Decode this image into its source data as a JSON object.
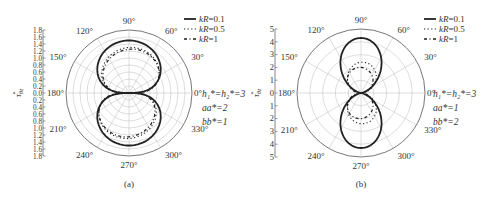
{
  "chart_data": [
    {
      "type": "polar-line",
      "panel_label": "(a)",
      "ylabel": "τ*_θz",
      "radial_range": [
        0,
        1.8
      ],
      "radial_ticks": [
        0.2,
        0.4,
        0.6,
        0.8,
        1.0,
        1.2,
        1.4,
        1.6,
        1.8
      ],
      "axis_tick_labels": [
        "1.8",
        "1.6",
        "1.4",
        "1.2",
        "1.0",
        "0.8",
        "0.6",
        "0.4",
        "0.2",
        "0.0",
        "0.2",
        "0.4",
        "0.6",
        "0.8",
        "1.0",
        "1.2",
        "1.4",
        "1.6",
        "1.8"
      ],
      "angle_labels": [
        "0°",
        "30°",
        "60°",
        "90°",
        "120°",
        "150°",
        "180°",
        "210°",
        "240°",
        "270°",
        "300°",
        "330°"
      ],
      "parameters": [
        "h₁*=h₂*=3",
        "aa*=2",
        "bb*=1"
      ],
      "legend": [
        {
          "name": "kR=0.1",
          "style": "solid"
        },
        {
          "name": "kR=0.5",
          "style": "dotted"
        },
        {
          "name": "kR=1",
          "style": "dashdot"
        }
      ],
      "series": [
        {
          "name": "kR=0.1",
          "peak": 1.5,
          "shape": "lobe",
          "width": 1.0,
          "style": "solid"
        },
        {
          "name": "kR=0.5",
          "peak": 1.3,
          "shape": "lobe",
          "width": 0.85,
          "skew": 0.25,
          "style": "dotted"
        },
        {
          "name": "kR=1",
          "peak": 1.25,
          "shape": "lobe",
          "width": 0.8,
          "skew": 0.35,
          "style": "dashdot"
        }
      ]
    },
    {
      "type": "polar-line",
      "panel_label": "(b)",
      "ylabel": "τ*_θz",
      "radial_range": [
        0,
        5
      ],
      "radial_ticks": [
        1,
        2,
        3,
        4,
        5
      ],
      "axis_tick_labels": [
        "5",
        "4",
        "3",
        "2",
        "1",
        "0",
        "1",
        "2",
        "3",
        "4",
        "5"
      ],
      "angle_labels": [
        "0°",
        "30°",
        "60°",
        "90°",
        "120°",
        "150°",
        "180°",
        "210°",
        "240°",
        "270°",
        "300°",
        "330°"
      ],
      "parameters": [
        "h₁*=h₂*=3",
        "aa*=1",
        "bb*=2"
      ],
      "legend": [
        {
          "name": "kR=0.1",
          "style": "solid"
        },
        {
          "name": "kR=0.5",
          "style": "dotted"
        },
        {
          "name": "kR=1",
          "style": "dashdot"
        }
      ],
      "series": [
        {
          "name": "kR=0.1",
          "peak": 4.3,
          "shape": "narrow",
          "width": 0.28,
          "style": "solid"
        },
        {
          "name": "kR=0.5",
          "peak": 2.4,
          "shape": "narrow",
          "width": 0.5,
          "skew": 0.3,
          "style": "dotted"
        },
        {
          "name": "kR=1",
          "peak": 2.0,
          "shape": "narrow",
          "width": 0.6,
          "skew": -0.3,
          "style": "dashdot"
        }
      ]
    }
  ]
}
